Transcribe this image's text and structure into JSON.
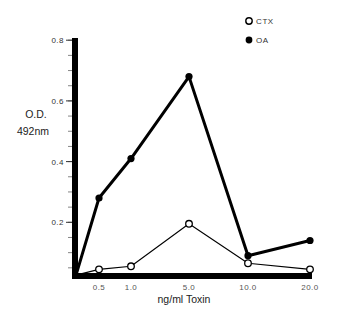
{
  "chart_data": {
    "type": "line",
    "title": "",
    "xlabel": "ng/ml Toxin",
    "ylabel_lines": [
      "O.D.",
      "492nm"
    ],
    "categories": [
      "0.5",
      "1.0",
      "5.0",
      "10.0",
      "20.0"
    ],
    "ylim": [
      0,
      0.8
    ],
    "yticks": [
      0.2,
      0.4,
      0.6,
      0.8
    ],
    "ytick_labels": [
      "0.2",
      "0.4",
      "0.6",
      "0.8"
    ],
    "y_minor_step": 0.05,
    "grid": false,
    "legend_position": "top-right",
    "series": [
      {
        "name": "CTX",
        "marker": "open-circle",
        "line": "thin",
        "values": [
          0.045,
          0.055,
          0.195,
          0.065,
          0.045
        ]
      },
      {
        "name": "OA",
        "marker": "filled-circle",
        "line": "thick",
        "values": [
          0.28,
          0.41,
          0.68,
          0.09,
          0.14
        ]
      }
    ],
    "origin_value": 0.026,
    "colors": {
      "line": "#000000",
      "background": "#ffffff"
    }
  }
}
